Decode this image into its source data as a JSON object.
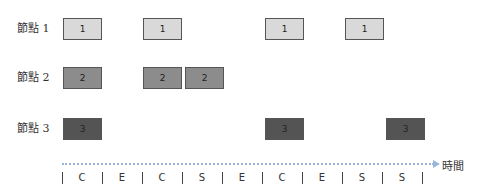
{
  "rows": [
    {
      "label": "節點 1",
      "box_text": "1"
    },
    {
      "label": "節點 2",
      "box_text": "2"
    },
    {
      "label": "節點 3",
      "box_text": "3"
    }
  ],
  "timeline": {
    "axis_label": "時間",
    "slots": [
      "C",
      "E",
      "C",
      "S",
      "E",
      "C",
      "E",
      "S",
      "S"
    ]
  },
  "boxes": [
    {
      "row": 1,
      "slot": 0,
      "text": "1"
    },
    {
      "row": 1,
      "slot": 2,
      "text": "1"
    },
    {
      "row": 1,
      "slot": 5,
      "text": "1"
    },
    {
      "row": 1,
      "slot": 7,
      "text": "1"
    },
    {
      "row": 2,
      "slot": 0,
      "text": "2"
    },
    {
      "row": 2,
      "slot": 2,
      "text": "2"
    },
    {
      "row": 2,
      "slot": 3,
      "text": "2"
    },
    {
      "row": 3,
      "slot": 0,
      "text": "3"
    },
    {
      "row": 3,
      "slot": 5,
      "text": "3"
    },
    {
      "row": 3,
      "slot": 8,
      "text": "3"
    }
  ],
  "colors": {
    "node1": "#d9d9d9",
    "node2": "#8c8c8c",
    "node3": "#545454",
    "axis": "#9ab6d8"
  }
}
